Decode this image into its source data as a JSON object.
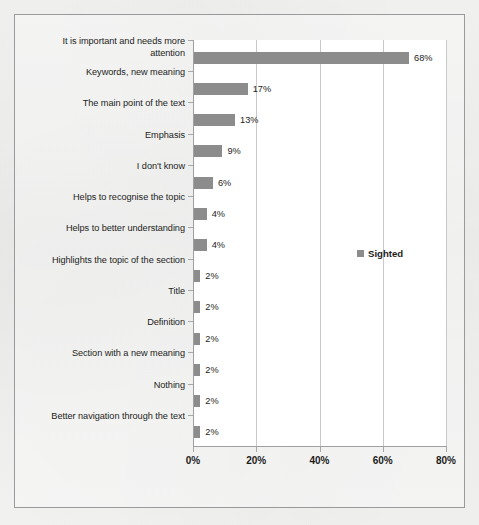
{
  "chart_data": {
    "type": "bar",
    "orientation": "horizontal",
    "title": "",
    "xlabel": "",
    "ylabel": "",
    "xlim": [
      0,
      80
    ],
    "xticks": [
      0,
      20,
      40,
      60,
      80
    ],
    "xtick_labels": [
      "0%",
      "20%",
      "40%",
      "60%",
      "80%"
    ],
    "grid": true,
    "grid_axis": "x",
    "legend": {
      "position": "middle-right-inside",
      "entries": [
        {
          "name": "Sighted",
          "color": "#8c8c8c"
        }
      ]
    },
    "categories": [
      "It is important and needs more attention",
      "Keywords, new meaning",
      "The main point of the text",
      "Emphasis",
      "I don't know",
      "Helps to recognise the topic",
      "Helps to better understanding",
      "Highlights the topic of the section",
      "Title",
      "Definition",
      "Section with a new meaning",
      "Nothing",
      "Better navigation through the text"
    ],
    "series": [
      {
        "name": "Sighted",
        "color": "#8c8c8c",
        "values": [
          68,
          17,
          13,
          9,
          6,
          4,
          4,
          2,
          2,
          2,
          2,
          2,
          2
        ],
        "value_labels": [
          "68%",
          "17%",
          "13%",
          "9%",
          "6%",
          "4%",
          "4%",
          "2%",
          "2%",
          "2%",
          "2%",
          "2%",
          "2%"
        ]
      }
    ]
  },
  "colors": {
    "bar": "#8c8c8c",
    "gridline": "#c9c9c9",
    "axis": "#a0a0a0",
    "text": "#1d1d1b",
    "plot_background": "#ffffff",
    "page_background": "#f2f2f1",
    "frame_border": "#9a9a9a"
  }
}
